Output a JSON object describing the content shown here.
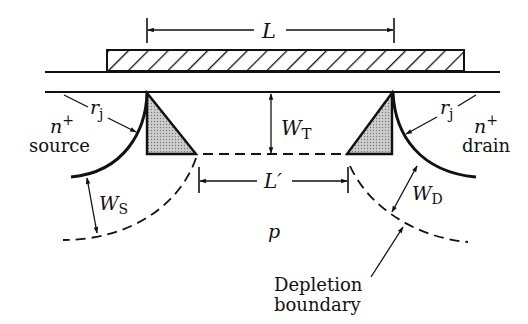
{
  "figure": {
    "type": "MOSFET cross-section (short-channel charge sharing)",
    "colors": {
      "ink": "#111111",
      "shade": "#bdbdbd",
      "background": "#ffffff"
    }
  },
  "labels": {
    "gate_length": "L",
    "effective_length": "L′",
    "depletion_depth": "W",
    "depletion_depth_sub": "T",
    "source_depletion": "W",
    "source_depletion_sub": "S",
    "drain_depletion": "W",
    "drain_depletion_sub": "D",
    "junction_radius_left": "r",
    "junction_radius_left_sub": "j",
    "junction_radius_right": "r",
    "junction_radius_right_sub": "j",
    "source_type": "n",
    "source_type_sup": "+",
    "source_name": "source",
    "drain_type": "n",
    "drain_type_sup": "+",
    "drain_name": "drain",
    "substrate": "p",
    "depletion_line1": "Depletion",
    "depletion_line2": "boundary"
  }
}
